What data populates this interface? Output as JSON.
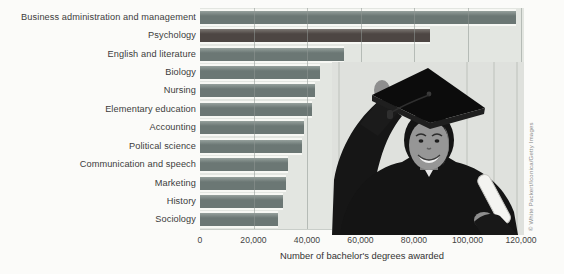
{
  "chart_data": {
    "type": "bar",
    "orientation": "horizontal",
    "title": "",
    "xlabel": "Number of bachelor's degrees awarded",
    "ylabel": "",
    "categories": [
      "Business administration and management",
      "Psychology",
      "English and literature",
      "Biology",
      "Nursing",
      "Elementary education",
      "Accounting",
      "Political science",
      "Communication and speech",
      "Marketing",
      "History",
      "Sociology"
    ],
    "values": [
      118000,
      86000,
      54000,
      45000,
      43000,
      42000,
      39000,
      38000,
      33000,
      32000,
      31000,
      29000
    ],
    "highlight_category": "Psychology",
    "xlim": [
      0,
      120000
    ],
    "x_ticks": [
      {
        "value": 0,
        "label": "0"
      },
      {
        "value": 20000,
        "label": "20,000"
      },
      {
        "value": 40000,
        "label": "40,000"
      },
      {
        "value": 60000,
        "label": "60,000"
      },
      {
        "value": 80000,
        "label": "80,000"
      },
      {
        "value": 100000,
        "label": "100,000"
      },
      {
        "value": 120000,
        "label": "120,000"
      }
    ],
    "grid": "vertical",
    "legend": "none",
    "colors": {
      "bar": "#6b7774",
      "bar_light": "#95a09c",
      "highlight": "#4d4643",
      "highlight_light": "#7b7672",
      "plot_bg": "#e3e6e1",
      "grid": "#8f9894",
      "page_bg": "#fbfbf9",
      "text": "#3c3c3c"
    }
  },
  "photo": {
    "description": "Smiling woman graduate in black cap and gown holding a diploma",
    "credit": "© White Packert/Iconica/Getty Images"
  }
}
